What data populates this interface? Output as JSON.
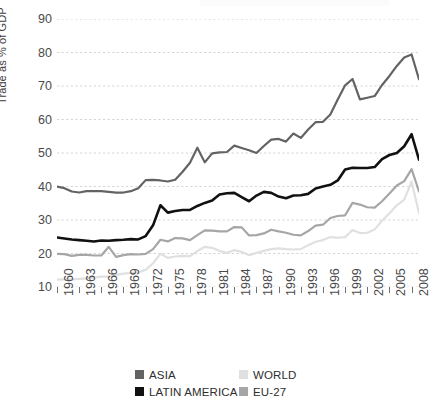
{
  "figure": {
    "background": "#ffffff",
    "caption_partial": "",
    "y_axis_title": "Trade as % of GDP"
  },
  "legend": {
    "position": "bottom-center",
    "entries": [
      {
        "label": "ASIA",
        "color": "#636363"
      },
      {
        "label": "WORLD",
        "color": "#e0e0e0"
      },
      {
        "label": "LATIN AMERICA",
        "color": "#111111"
      },
      {
        "label": "EU-27",
        "color": "#a6a6a6"
      }
    ]
  },
  "axes": {
    "y_ticks": [
      10,
      20,
      30,
      40,
      50,
      60,
      70,
      80,
      90
    ],
    "x_ticks": [
      1960,
      1963,
      1966,
      1969,
      1972,
      1975,
      1978,
      1981,
      1984,
      1987,
      1990,
      1993,
      1996,
      1999,
      2002,
      2005,
      2008
    ],
    "grid": "horizontal-dashed"
  },
  "chart_data": {
    "type": "line",
    "title": "",
    "xlabel": "",
    "ylabel": "Trade as % of GDP",
    "xlim": [
      1960,
      2009
    ],
    "ylim": [
      10,
      90
    ],
    "ytick_step": 10,
    "xtick_step": 3,
    "grid": true,
    "legend_position": "bottom-center",
    "x": [
      1960,
      1961,
      1962,
      1963,
      1964,
      1965,
      1966,
      1967,
      1968,
      1969,
      1970,
      1971,
      1972,
      1973,
      1974,
      1975,
      1976,
      1977,
      1978,
      1979,
      1980,
      1981,
      1982,
      1983,
      1984,
      1985,
      1986,
      1987,
      1988,
      1989,
      1990,
      1991,
      1992,
      1993,
      1994,
      1995,
      1996,
      1997,
      1998,
      1999,
      2000,
      2001,
      2002,
      2003,
      2004,
      2005,
      2006,
      2007,
      2008,
      2009
    ],
    "series": [
      {
        "name": "ASIA",
        "color": "#636363",
        "values": [
          40.0,
          39.5,
          38.5,
          38.2,
          38.6,
          38.6,
          38.6,
          38.4,
          38.2,
          38.2,
          38.6,
          39.5,
          41.9,
          42.0,
          41.8,
          41.5,
          42.0,
          44.4,
          47.1,
          51.6,
          47.2,
          49.9,
          50.2,
          50.3,
          52.2,
          51.5,
          50.8,
          50.0,
          52.1,
          54.0,
          54.2,
          53.4,
          55.8,
          54.5,
          57.0,
          59.2,
          59.3,
          61.5,
          66.0,
          70.2,
          72.1,
          66.0,
          66.5,
          67.0,
          70.3,
          73.0,
          76.0,
          78.5,
          79.4,
          72.0
        ]
      },
      {
        "name": "WORLD",
        "color": "#e0e0e0",
        "values": [
          12.2,
          12.3,
          12.3,
          12.4,
          12.6,
          12.8,
          13.1,
          13.1,
          13.6,
          14.0,
          14.2,
          14.4,
          15.1,
          17.1,
          19.9,
          18.7,
          19.1,
          19.3,
          19.2,
          20.7,
          22.0,
          21.7,
          20.8,
          20.2,
          21.0,
          20.5,
          19.5,
          20.2,
          20.8,
          21.3,
          21.5,
          21.3,
          21.2,
          21.3,
          22.5,
          23.5,
          24.0,
          24.9,
          24.7,
          24.9,
          27.0,
          26.1,
          26.2,
          27.2,
          29.8,
          32.0,
          34.4,
          36.1,
          41.5,
          32.0
        ]
      },
      {
        "name": "LATIN AMERICA",
        "color": "#111111",
        "values": [
          24.8,
          24.5,
          24.2,
          24.0,
          23.8,
          23.6,
          23.9,
          23.8,
          24.0,
          24.1,
          24.3,
          24.2,
          25.2,
          28.4,
          34.4,
          32.2,
          32.7,
          33.0,
          33.0,
          34.2,
          35.1,
          35.8,
          37.6,
          38.0,
          38.1,
          36.8,
          35.6,
          37.3,
          38.4,
          38.1,
          37.0,
          36.5,
          37.3,
          37.4,
          37.8,
          39.4,
          40.0,
          40.5,
          41.8,
          45.1,
          45.6,
          45.5,
          45.5,
          45.8,
          48.2,
          49.4,
          50.0,
          52.0,
          55.6,
          48.0
        ]
      },
      {
        "name": "EU-27",
        "color": "#a6a6a6",
        "values": [
          19.9,
          19.8,
          19.3,
          19.6,
          19.6,
          19.4,
          19.4,
          22.0,
          19.0,
          19.5,
          19.8,
          19.7,
          19.9,
          21.3,
          24.1,
          23.6,
          24.6,
          24.5,
          24.0,
          25.5,
          26.9,
          26.8,
          26.6,
          26.6,
          27.9,
          27.8,
          25.4,
          25.5,
          26.0,
          27.1,
          26.6,
          26.2,
          25.6,
          25.4,
          26.7,
          28.3,
          28.6,
          30.6,
          31.2,
          31.4,
          35.1,
          34.6,
          33.8,
          33.7,
          35.6,
          37.9,
          40.3,
          41.6,
          45.2,
          38.5
        ]
      }
    ]
  }
}
